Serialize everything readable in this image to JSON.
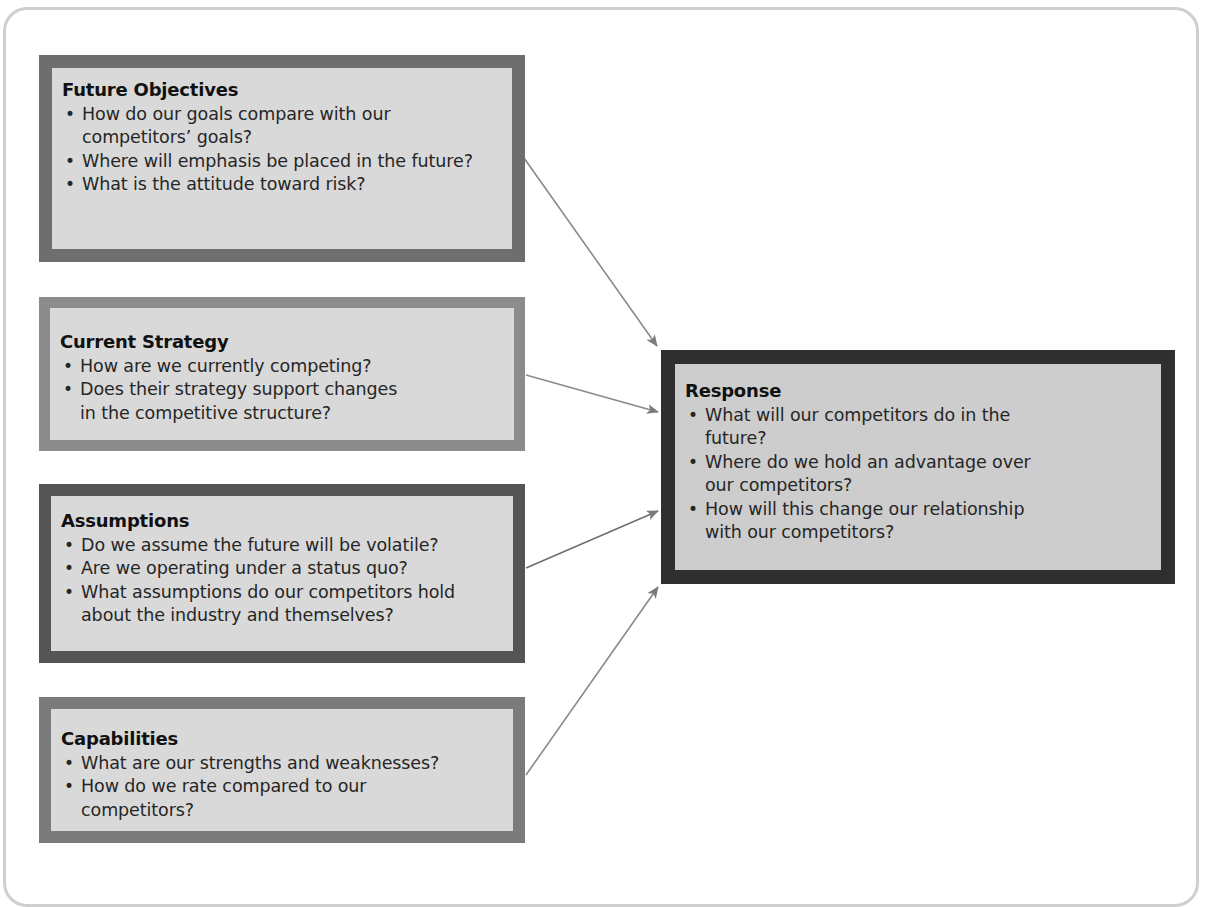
{
  "diagram": {
    "colors": {
      "background": "#ffffff",
      "frame_border": "#cfcfcf",
      "box_fill": "#d9d9d9",
      "response_fill": "#cdcdcd",
      "arrow": "#7a7a7a",
      "future_border": "#6e6e6e",
      "current_border": "#8c8c8c",
      "assumptions_border": "#555555",
      "capabilities_border": "#7b7b7b",
      "response_border": "#2f2f2f"
    },
    "boxes": {
      "future_objectives": {
        "title": "Future Objectives",
        "items": [
          "How do our goals compare with our competitors’ goals?",
          "Where will emphasis be placed in the future?",
          "What is the attitude toward risk?"
        ]
      },
      "current_strategy": {
        "title": "Current Strategy",
        "items": [
          "How are we currently competing?",
          "Does their strategy support changes in the competitive structure?"
        ]
      },
      "assumptions": {
        "title": "Assumptions",
        "items": [
          "Do we assume the future will be volatile?",
          "Are we operating under a status quo?",
          "What assumptions do our competitors hold about the industry and themselves?"
        ]
      },
      "capabilities": {
        "title": "Capabilities",
        "items": [
          "What are our strengths and weaknesses?",
          "How do we rate compared to our competitors?"
        ]
      },
      "response": {
        "title": "Response",
        "items": [
          "What will our competitors do in the future?",
          "Where do we hold an advantage over our competitors?",
          "How will this change our relationship with our competitors?"
        ]
      }
    },
    "arrows": [
      {
        "from": "future_objectives",
        "to": "response",
        "icon": "arrow-right-icon"
      },
      {
        "from": "current_strategy",
        "to": "response",
        "icon": "arrow-right-icon"
      },
      {
        "from": "assumptions",
        "to": "response",
        "icon": "arrow-right-icon"
      },
      {
        "from": "capabilities",
        "to": "response",
        "icon": "arrow-right-icon"
      }
    ]
  }
}
